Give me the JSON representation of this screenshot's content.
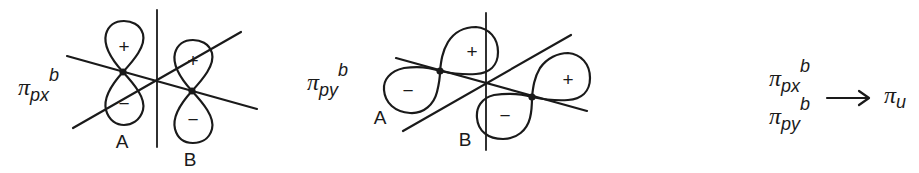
{
  "diagram": {
    "stroke_color": "#1a1a1a",
    "background": "#ffffff",
    "panels": [
      {
        "id": "pi-px-b",
        "label": {
          "symbol": "π",
          "subscript": "px",
          "superscript": "b"
        },
        "atoms": [
          {
            "name": "A",
            "label": "A"
          },
          {
            "name": "B",
            "label": "B"
          }
        ],
        "lobes": [
          {
            "atom": "A",
            "sign": "+",
            "position": "upper"
          },
          {
            "atom": "A",
            "sign": "−",
            "position": "lower"
          },
          {
            "atom": "B",
            "sign": "+",
            "position": "upper"
          },
          {
            "atom": "B",
            "sign": "−",
            "position": "lower"
          }
        ]
      },
      {
        "id": "pi-py-b",
        "label": {
          "symbol": "π",
          "subscript": "py",
          "superscript": "b"
        },
        "atoms": [
          {
            "name": "A",
            "label": "A"
          },
          {
            "name": "B",
            "label": "B"
          }
        ],
        "lobes": [
          {
            "atom": "A",
            "sign": "−",
            "position": "left"
          },
          {
            "atom": "A",
            "sign": "+",
            "position": "right"
          },
          {
            "atom": "B",
            "sign": "−",
            "position": "left"
          },
          {
            "atom": "B",
            "sign": "+",
            "position": "right"
          }
        ]
      }
    ],
    "equation": {
      "inputs": [
        {
          "symbol": "π",
          "subscript": "px",
          "superscript": "b"
        },
        {
          "symbol": "π",
          "subscript": "py",
          "superscript": "b"
        }
      ],
      "arrow": "→",
      "output": {
        "symbol": "π",
        "subscript": "u"
      }
    }
  }
}
